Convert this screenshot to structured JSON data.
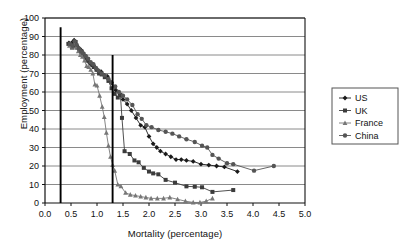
{
  "chart_data": {
    "type": "line",
    "title": "",
    "xlabel": "Mortality (percentage)",
    "ylabel": "Employment (percentage)",
    "xlim": [
      0.0,
      5.0
    ],
    "ylim": [
      0,
      100
    ],
    "xticks": [
      "0.0",
      "0.5",
      "1.0",
      "1.5",
      "2.0",
      "2.5",
      "3.0",
      "3.5",
      "4.0",
      "4.5",
      "5.0"
    ],
    "yticks": [
      "0",
      "10",
      "20",
      "30",
      "40",
      "50",
      "60",
      "70",
      "80",
      "90",
      "100"
    ],
    "grid": "horizontal",
    "legend_position": "right",
    "reference_lines": [
      {
        "name": "threshold-line-low",
        "x": 0.3,
        "y_top": 95,
        "y_bottom": 0
      },
      {
        "name": "threshold-line-high",
        "x": 1.3,
        "y_top": 80,
        "y_bottom": 0
      }
    ],
    "series": [
      {
        "name": "US",
        "marker": "diamond",
        "color": "#1a1a1a",
        "points": [
          [
            0.46,
            86.5
          ],
          [
            0.5,
            85.0
          ],
          [
            0.53,
            87.0
          ],
          [
            0.56,
            88.0
          ],
          [
            0.58,
            86.0
          ],
          [
            0.61,
            85.0
          ],
          [
            0.64,
            84.0
          ],
          [
            0.67,
            83.0
          ],
          [
            0.7,
            82.5
          ],
          [
            0.73,
            81.0
          ],
          [
            0.77,
            79.0
          ],
          [
            0.8,
            78.0
          ],
          [
            0.84,
            76.5
          ],
          [
            0.88,
            75.0
          ],
          [
            0.92,
            74.0
          ],
          [
            0.97,
            73.0
          ],
          [
            1.02,
            71.5
          ],
          [
            1.08,
            71.0
          ],
          [
            1.14,
            69.0
          ],
          [
            1.2,
            68.5
          ],
          [
            1.28,
            65.0
          ],
          [
            1.36,
            61.0
          ],
          [
            1.44,
            58.5
          ],
          [
            1.5,
            56.0
          ],
          [
            1.58,
            53.5
          ],
          [
            1.66,
            50.0
          ],
          [
            1.75,
            46.0
          ],
          [
            1.84,
            42.0
          ],
          [
            1.92,
            41.0
          ],
          [
            2.0,
            36.0
          ],
          [
            2.08,
            32.0
          ],
          [
            2.15,
            30.0
          ],
          [
            2.22,
            28.0
          ],
          [
            2.32,
            26.5
          ],
          [
            2.42,
            25.0
          ],
          [
            2.52,
            23.5
          ],
          [
            2.62,
            23.5
          ],
          [
            2.72,
            23.0
          ],
          [
            2.85,
            22.5
          ],
          [
            3.0,
            21.0
          ],
          [
            3.15,
            20.5
          ],
          [
            3.3,
            20.0
          ],
          [
            3.45,
            19.5
          ],
          [
            3.7,
            17.0
          ]
        ]
      },
      {
        "name": "UK",
        "marker": "square",
        "color": "#3c3c3c",
        "points": [
          [
            0.45,
            86.0
          ],
          [
            0.49,
            85.5
          ],
          [
            0.52,
            84.0
          ],
          [
            0.56,
            85.0
          ],
          [
            0.59,
            87.0
          ],
          [
            0.62,
            84.0
          ],
          [
            0.66,
            83.0
          ],
          [
            0.7,
            82.0
          ],
          [
            0.74,
            80.5
          ],
          [
            0.78,
            79.0
          ],
          [
            0.82,
            77.0
          ],
          [
            0.86,
            76.0
          ],
          [
            0.9,
            75.0
          ],
          [
            0.94,
            73.5
          ],
          [
            0.99,
            72.0
          ],
          [
            1.04,
            70.0
          ],
          [
            1.09,
            69.5
          ],
          [
            1.15,
            68.0
          ],
          [
            1.22,
            66.0
          ],
          [
            1.28,
            62.0
          ],
          [
            1.34,
            59.0
          ],
          [
            1.4,
            57.0
          ],
          [
            1.45,
            58.5
          ],
          [
            1.48,
            46.0
          ],
          [
            1.53,
            28.0
          ],
          [
            1.63,
            26.5
          ],
          [
            1.72,
            23.0
          ],
          [
            1.8,
            22.0
          ],
          [
            1.9,
            19.0
          ],
          [
            2.0,
            17.0
          ],
          [
            2.08,
            16.0
          ],
          [
            2.18,
            15.5
          ],
          [
            2.32,
            12.5
          ],
          [
            2.5,
            11.0
          ],
          [
            2.72,
            9.0
          ],
          [
            2.88,
            8.8
          ],
          [
            3.02,
            8.5
          ],
          [
            3.22,
            6.0
          ],
          [
            3.62,
            7.0
          ]
        ]
      },
      {
        "name": "France",
        "marker": "triangle",
        "color": "#777777",
        "points": [
          [
            0.47,
            85.0
          ],
          [
            0.52,
            84.5
          ],
          [
            0.56,
            86.0
          ],
          [
            0.6,
            84.0
          ],
          [
            0.64,
            82.0
          ],
          [
            0.68,
            80.0
          ],
          [
            0.72,
            79.0
          ],
          [
            0.76,
            77.0
          ],
          [
            0.8,
            74.0
          ],
          [
            0.84,
            73.5
          ],
          [
            0.88,
            72.0
          ],
          [
            0.92,
            70.0
          ],
          [
            0.96,
            64.0
          ],
          [
            1.0,
            63.5
          ],
          [
            1.05,
            58.0
          ],
          [
            1.1,
            52.0
          ],
          [
            1.14,
            46.5
          ],
          [
            1.18,
            38.0
          ],
          [
            1.22,
            31.0
          ],
          [
            1.26,
            25.0
          ],
          [
            1.3,
            20.5
          ],
          [
            1.34,
            17.5
          ],
          [
            1.4,
            10.0
          ],
          [
            1.46,
            9.0
          ],
          [
            1.55,
            5.5
          ],
          [
            1.64,
            4.5
          ],
          [
            1.74,
            4.0
          ],
          [
            1.84,
            3.5
          ],
          [
            1.94,
            3.0
          ],
          [
            2.04,
            2.5
          ],
          [
            2.16,
            2.5
          ],
          [
            2.28,
            2.5
          ],
          [
            2.4,
            3.0
          ],
          [
            2.55,
            2.0
          ],
          [
            2.7,
            1.0
          ],
          [
            2.85,
            0.3
          ],
          [
            2.98,
            0.3
          ],
          [
            3.1,
            1.0
          ],
          [
            3.22,
            2.5
          ]
        ]
      },
      {
        "name": "China",
        "marker": "circle",
        "color": "#555555",
        "points": [
          [
            0.48,
            86.0
          ],
          [
            0.53,
            85.0
          ],
          [
            0.57,
            87.5
          ],
          [
            0.61,
            85.5
          ],
          [
            0.65,
            83.5
          ],
          [
            0.69,
            82.0
          ],
          [
            0.73,
            81.0
          ],
          [
            0.78,
            79.5
          ],
          [
            0.83,
            78.0
          ],
          [
            0.88,
            76.0
          ],
          [
            0.93,
            75.0
          ],
          [
            0.98,
            73.0
          ],
          [
            1.03,
            71.5
          ],
          [
            1.09,
            70.0
          ],
          [
            1.15,
            69.0
          ],
          [
            1.22,
            67.0
          ],
          [
            1.28,
            65.0
          ],
          [
            1.35,
            63.0
          ],
          [
            1.42,
            60.0
          ],
          [
            1.5,
            58.0
          ],
          [
            1.58,
            56.0
          ],
          [
            1.68,
            53.0
          ],
          [
            1.78,
            48.0
          ],
          [
            1.86,
            45.5
          ],
          [
            1.95,
            42.0
          ],
          [
            2.05,
            41.0
          ],
          [
            2.18,
            39.5
          ],
          [
            2.32,
            38.5
          ],
          [
            2.45,
            37.5
          ],
          [
            2.58,
            36.0
          ],
          [
            2.72,
            34.5
          ],
          [
            2.88,
            33.0
          ],
          [
            3.02,
            31.0
          ],
          [
            3.12,
            30.0
          ],
          [
            3.22,
            26.0
          ],
          [
            3.34,
            24.0
          ],
          [
            3.5,
            21.5
          ],
          [
            3.62,
            21.0
          ],
          [
            4.02,
            17.5
          ],
          [
            4.4,
            20.0
          ]
        ]
      }
    ]
  },
  "legend": {
    "items": [
      {
        "label": "US"
      },
      {
        "label": "UK"
      },
      {
        "label": "France"
      },
      {
        "label": "China"
      }
    ]
  }
}
